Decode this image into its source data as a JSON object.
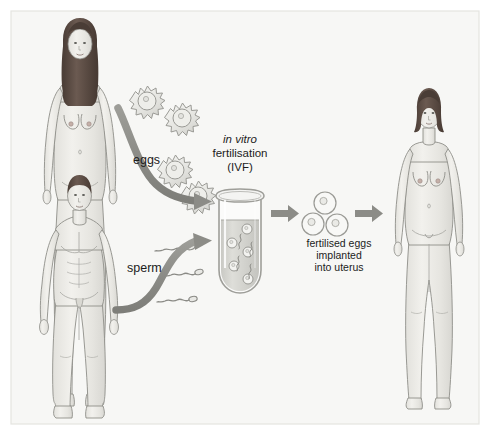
{
  "figure": {
    "width": 490,
    "height": 435,
    "background_color": "#f7f7f5",
    "frame_color": "#e2e2de",
    "page_color": "#ffffff"
  },
  "labels": {
    "eggs": "eggs",
    "sperm": "sperm",
    "ivf_line1_italic": "in vitro",
    "ivf_line2": "fertilisation",
    "ivf_line3": "(IVF)",
    "caption_line1": "fertilised eggs",
    "caption_line2": "implanted",
    "caption_line3": "into uterus"
  },
  "figures": {
    "woman_donor": {
      "name": "egg donor woman",
      "hair": "long dark brown hair",
      "hair_color": "#5a4b45",
      "skin_color": "#ecebe7",
      "outline_color": "#8b8b86"
    },
    "man_donor": {
      "name": "sperm donor man",
      "hair": "short dark brown hair",
      "hair_color": "#5a4b45",
      "skin_color": "#ecebe7",
      "outline_color": "#8b8b86"
    },
    "woman_recipient": {
      "name": "recipient woman",
      "hair": "short dark brown bob",
      "hair_color": "#4d4039",
      "skin_color": "#ecebe7",
      "outline_color": "#8b8b86"
    }
  },
  "cells": {
    "eggs_count": 4,
    "egg_fill": "#e8e8e4",
    "egg_outline": "#9a9a95",
    "sperm_count": 3,
    "sperm_color": "#8a8a85",
    "fertilised_eggs_count": 3,
    "fertilised_egg_fill": "#f4f4f1",
    "fertilised_egg_outline": "#9a9a95"
  },
  "test_tube": {
    "name": "test tube",
    "liquid_color": "#d2d2cd",
    "glass_color": "#9e9e99",
    "contents": "eggs and sperm in culture medium",
    "eggs_inside": 5,
    "sperm_inside": 4
  },
  "arrows": {
    "color": "#8e8e89",
    "count": 4,
    "items": [
      {
        "name": "eggs-to-tube",
        "type": "curved"
      },
      {
        "name": "sperm-to-tube",
        "type": "curved"
      },
      {
        "name": "tube-to-fertilised-eggs",
        "type": "straight"
      },
      {
        "name": "fertilised-eggs-to-uterus",
        "type": "straight"
      }
    ]
  }
}
